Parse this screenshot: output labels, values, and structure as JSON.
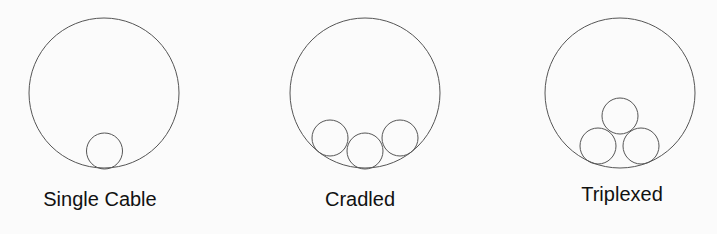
{
  "diagram": {
    "colors": {
      "stroke": "#555555",
      "text": "#111111",
      "background": "#fbfbfb"
    },
    "panels": [
      {
        "id": "single-cable",
        "label": "Single Cable",
        "label_pos": {
          "x": 100,
          "y": 206
        },
        "conduit": {
          "cx": 104,
          "cy": 93,
          "r": 75
        },
        "cables": [
          {
            "cx": 104.5,
            "cy": 151,
            "r": 18
          }
        ]
      },
      {
        "id": "cradled",
        "label": "Cradled",
        "label_pos": {
          "x": 360,
          "y": 206
        },
        "conduit": {
          "cx": 365,
          "cy": 93,
          "r": 75
        },
        "cables": [
          {
            "cx": 330,
            "cy": 138,
            "r": 18
          },
          {
            "cx": 365,
            "cy": 151,
            "r": 18
          },
          {
            "cx": 400,
            "cy": 138,
            "r": 18
          }
        ]
      },
      {
        "id": "triplexed",
        "label": "Triplexed",
        "label_pos": {
          "x": 622,
          "y": 201
        },
        "conduit": {
          "cx": 620,
          "cy": 93,
          "r": 75
        },
        "cables": [
          {
            "cx": 620,
            "cy": 116,
            "r": 18
          },
          {
            "cx": 598,
            "cy": 146,
            "r": 18
          },
          {
            "cx": 641,
            "cy": 146,
            "r": 18
          }
        ]
      }
    ]
  }
}
